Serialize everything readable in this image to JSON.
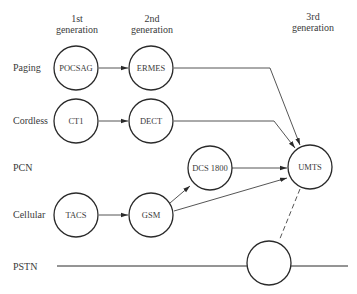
{
  "headers": {
    "gen1": [
      "1st",
      "generation"
    ],
    "gen2": [
      "2nd",
      "generation"
    ],
    "gen3": [
      "3rd",
      "generation"
    ]
  },
  "rows": {
    "paging": "Paging",
    "cordless": "Cordless",
    "pcn": "PCN",
    "cellular": "Cellular",
    "pstn": "PSTN"
  },
  "nodes": {
    "pocsag": "POCSAG",
    "ermes": "ERMES",
    "ct1": "CT1",
    "dect": "DECT",
    "dcs1800": "DCS 1800",
    "umts": "UMTS",
    "tacs": "TACS",
    "gsm": "GSM",
    "pstn_node": ""
  },
  "edges": [
    {
      "from": "POCSAG",
      "to": "ERMES",
      "style": "arrow"
    },
    {
      "from": "ERMES",
      "to": "UMTS",
      "style": "arrow"
    },
    {
      "from": "CT1",
      "to": "DECT",
      "style": "arrow"
    },
    {
      "from": "DECT",
      "to": "UMTS",
      "style": "arrow"
    },
    {
      "from": "TACS",
      "to": "GSM",
      "style": "arrow"
    },
    {
      "from": "GSM",
      "to": "DCS 1800",
      "style": "arrow"
    },
    {
      "from": "GSM",
      "to": "UMTS",
      "style": "arrow"
    },
    {
      "from": "DCS 1800",
      "to": "UMTS",
      "style": "arrow"
    },
    {
      "from": "UMTS",
      "to": "PSTN node",
      "style": "dashed"
    }
  ],
  "colors": {
    "stroke": "#2a2a2a",
    "text": "#3a3a3a",
    "background": "#ffffff"
  }
}
